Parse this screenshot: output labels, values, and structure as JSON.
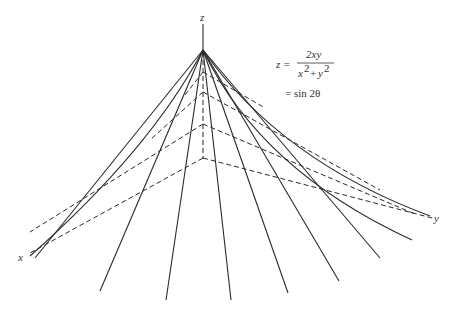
{
  "diagram": {
    "axes": {
      "z_label": "z",
      "x_label": "x",
      "y_label": "y"
    },
    "equation": {
      "lhs": "z =",
      "numerator": "2xy",
      "denominator_x": "x",
      "denominator_plus": "+",
      "denominator_y": "y",
      "exponent": "2",
      "line2": "= sin 2θ"
    },
    "apex": [
      203,
      50
    ],
    "origin": [
      203,
      158
    ],
    "rulings_endpoints": [
      [
        30,
        256
      ],
      [
        100,
        291
      ],
      [
        166,
        300
      ],
      [
        231,
        300
      ],
      [
        288,
        293
      ],
      [
        339,
        281
      ],
      [
        380,
        258
      ],
      [
        412,
        240
      ],
      [
        430,
        216
      ]
    ]
  }
}
